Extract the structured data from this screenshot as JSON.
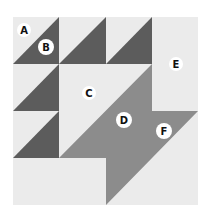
{
  "colors": {
    "background": "#ebebeb",
    "dark": "#5c5c5c",
    "medium": "#8c8c8c",
    "label_bg": "#ffffff",
    "label_text": "#111111"
  },
  "labels": {
    "a": "A",
    "b": "B",
    "c": "C",
    "d": "D",
    "e": "E",
    "f": "F"
  }
}
